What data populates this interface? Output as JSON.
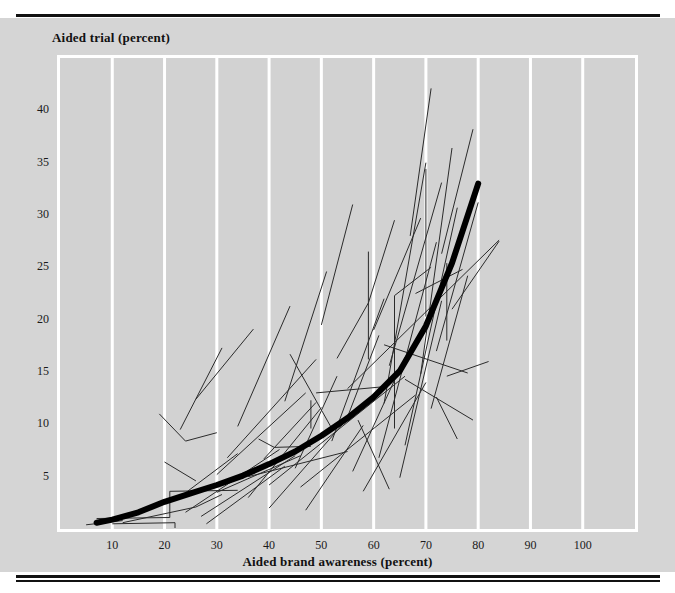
{
  "chart_data": {
    "type": "line",
    "title": "",
    "xlabel": "Aided brand awareness (percent)",
    "ylabel": "Aided trial (percent)",
    "xlim": [
      0,
      110
    ],
    "ylim": [
      0,
      45
    ],
    "xticks": [
      10,
      20,
      30,
      40,
      50,
      60,
      70,
      80,
      90,
      100
    ],
    "yticks": [
      5,
      10,
      15,
      20,
      25,
      30,
      35,
      40
    ],
    "grid": "vertical-white-gridlines-at-every-x-tick",
    "legend": "none",
    "annotations": [],
    "background_color": "#d2d2d2",
    "gridline_color": "#ffffff",
    "series_line_color": "#2b2b2b",
    "trend_line_color": "#000000",
    "trend": {
      "name": "average trial-vs-awareness curve",
      "emphasis": "thick",
      "x": [
        7,
        10,
        15,
        20,
        25,
        30,
        35,
        40,
        45,
        50,
        55,
        60,
        65,
        70,
        75,
        80
      ],
      "y": [
        0.6,
        0.9,
        1.6,
        2.6,
        3.4,
        4.2,
        5.1,
        6.2,
        7.4,
        8.9,
        10.6,
        12.6,
        15.1,
        19.4,
        25.4,
        33.0
      ]
    },
    "series": [
      {
        "name": "brand 1",
        "x": [
          5,
          12
        ],
        "y": [
          0.4,
          0.8
        ]
      },
      {
        "name": "brand 2",
        "x": [
          7,
          21,
          21,
          34
        ],
        "y": [
          1.0,
          1.1,
          3.6,
          3.7
        ]
      },
      {
        "name": "brand 3",
        "x": [
          10,
          22,
          22
        ],
        "y": [
          0.5,
          0.6,
          0.1
        ]
      },
      {
        "name": "brand 4",
        "x": [
          12,
          26,
          31
        ],
        "y": [
          0.6,
          2.1,
          3.3
        ]
      },
      {
        "name": "brand 5",
        "x": [
          20,
          26
        ],
        "y": [
          6.4,
          4.6
        ]
      },
      {
        "name": "brand 6",
        "x": [
          19,
          24,
          30
        ],
        "y": [
          11.0,
          8.4,
          9.2
        ]
      },
      {
        "name": "brand 7",
        "x": [
          23,
          31
        ],
        "y": [
          9.5,
          17.3
        ]
      },
      {
        "name": "brand 8",
        "x": [
          26,
          37
        ],
        "y": [
          12.4,
          19.1
        ]
      },
      {
        "name": "brand 9",
        "x": [
          22,
          34
        ],
        "y": [
          2.7,
          7.2
        ]
      },
      {
        "name": "brand 10",
        "x": [
          24,
          42
        ],
        "y": [
          1.6,
          7.6
        ]
      },
      {
        "name": "brand 11",
        "x": [
          27,
          45
        ],
        "y": [
          1.2,
          7.0
        ]
      },
      {
        "name": "brand 12",
        "x": [
          28,
          43
        ],
        "y": [
          0.5,
          6.0
        ]
      },
      {
        "name": "brand 13",
        "x": [
          30,
          47
        ],
        "y": [
          5.2,
          13.0
        ]
      },
      {
        "name": "brand 14",
        "x": [
          32,
          49
        ],
        "y": [
          6.8,
          16.2
        ]
      },
      {
        "name": "brand 15",
        "x": [
          34,
          44
        ],
        "y": [
          9.8,
          21.3
        ]
      },
      {
        "name": "brand 16",
        "x": [
          36,
          50
        ],
        "y": [
          3.0,
          11.6
        ]
      },
      {
        "name": "brand 17",
        "x": [
          38,
          41,
          48
        ],
        "y": [
          8.6,
          7.8,
          7.9
        ]
      },
      {
        "name": "brand 18",
        "x": [
          39,
          49
        ],
        "y": [
          6.7,
          12.1
        ]
      },
      {
        "name": "brand 19",
        "x": [
          40,
          56
        ],
        "y": [
          2.0,
          11.1
        ]
      },
      {
        "name": "brand 20",
        "x": [
          43,
          51
        ],
        "y": [
          12.2,
          24.6
        ]
      },
      {
        "name": "brand 21",
        "x": [
          45,
          53
        ],
        "y": [
          5.8,
          14.6
        ]
      },
      {
        "name": "brand 22",
        "x": [
          47,
          58
        ],
        "y": [
          1.8,
          9.9
        ]
      },
      {
        "name": "brand 23",
        "x": [
          48,
          48
        ],
        "y": [
          12.3,
          9.6
        ]
      },
      {
        "name": "brand 24",
        "x": [
          49,
          62
        ],
        "y": [
          13.0,
          13.6
        ]
      },
      {
        "name": "brand 25",
        "x": [
          50,
          56
        ],
        "y": [
          19.5,
          31.0
        ]
      },
      {
        "name": "brand 26",
        "x": [
          52,
          62
        ],
        "y": [
          8.4,
          22.0
        ]
      },
      {
        "name": "brand 27",
        "x": [
          53,
          59,
          64
        ],
        "y": [
          16.3,
          21.6,
          29.5
        ]
      },
      {
        "name": "brand 28",
        "x": [
          55,
          61
        ],
        "y": [
          10.7,
          18.5
        ]
      },
      {
        "name": "brand 29",
        "x": [
          56,
          66
        ],
        "y": [
          5.5,
          16.4
        ]
      },
      {
        "name": "brand 30",
        "x": [
          58,
          70
        ],
        "y": [
          3.6,
          14.0
        ]
      },
      {
        "name": "brand 31",
        "x": [
          59,
          59
        ],
        "y": [
          16.2,
          26.5
        ]
      },
      {
        "name": "brand 32",
        "x": [
          60,
          69
        ],
        "y": [
          19.0,
          29.7
        ]
      },
      {
        "name": "brand 33",
        "x": [
          61,
          72
        ],
        "y": [
          6.8,
          27.4
        ]
      },
      {
        "name": "brand 34",
        "x": [
          62,
          70
        ],
        "y": [
          12.0,
          35.0
        ]
      },
      {
        "name": "brand 35",
        "x": [
          63,
          73
        ],
        "y": [
          15.6,
          33.1
        ]
      },
      {
        "name": "brand 36",
        "x": [
          64,
          64,
          71
        ],
        "y": [
          9.6,
          22.3,
          25.0
        ]
      },
      {
        "name": "brand 37",
        "x": [
          65,
          73
        ],
        "y": [
          4.9,
          21.8
        ]
      },
      {
        "name": "brand 38",
        "x": [
          66,
          76
        ],
        "y": [
          8.0,
          30.7
        ]
      },
      {
        "name": "brand 39",
        "x": [
          67,
          71
        ],
        "y": [
          28.0,
          42.1
        ]
      },
      {
        "name": "brand 40",
        "x": [
          68,
          77
        ],
        "y": [
          22.5,
          24.8
        ]
      },
      {
        "name": "brand 41",
        "x": [
          69,
          75
        ],
        "y": [
          14.8,
          36.4
        ]
      },
      {
        "name": "brand 42",
        "x": [
          70,
          70
        ],
        "y": [
          20.3,
          34.4
        ]
      },
      {
        "name": "brand 43",
        "x": [
          71,
          78
        ],
        "y": [
          11.5,
          24.2
        ]
      },
      {
        "name": "brand 44",
        "x": [
          72,
          80
        ],
        "y": [
          17.0,
          31.2
        ]
      },
      {
        "name": "brand 45",
        "x": [
          73,
          79
        ],
        "y": [
          26.3,
          38.2
        ]
      },
      {
        "name": "brand 46",
        "x": [
          74,
          74
        ],
        "y": [
          18.0,
          25.4
        ]
      },
      {
        "name": "brand 47",
        "x": [
          75,
          84
        ],
        "y": [
          21.0,
          27.5
        ]
      },
      {
        "name": "brand 48",
        "x": [
          55,
          84
        ],
        "y": [
          13.4,
          27.6
        ]
      },
      {
        "name": "brand 49",
        "x": [
          62,
          78
        ],
        "y": [
          17.6,
          14.9
        ]
      },
      {
        "name": "brand 50",
        "x": [
          66,
          79
        ],
        "y": [
          14.3,
          10.4
        ]
      },
      {
        "name": "brand 51",
        "x": [
          40,
          66
        ],
        "y": [
          4.2,
          14.6
        ]
      },
      {
        "name": "brand 52",
        "x": [
          36,
          55
        ],
        "y": [
          5.0,
          7.4
        ]
      },
      {
        "name": "brand 53",
        "x": [
          30,
          46
        ],
        "y": [
          3.5,
          7.0
        ]
      },
      {
        "name": "brand 54",
        "x": [
          46,
          68
        ],
        "y": [
          4.0,
          12.8
        ]
      },
      {
        "name": "brand 55",
        "x": [
          44,
          52
        ],
        "y": [
          16.7,
          9.6
        ]
      },
      {
        "name": "brand 56",
        "x": [
          57,
          63
        ],
        "y": [
          10.4,
          3.8
        ]
      },
      {
        "name": "brand 57",
        "x": [
          74,
          82
        ],
        "y": [
          14.6,
          16.0
        ]
      },
      {
        "name": "brand 58",
        "x": [
          72,
          76
        ],
        "y": [
          12.6,
          8.6
        ]
      }
    ]
  }
}
